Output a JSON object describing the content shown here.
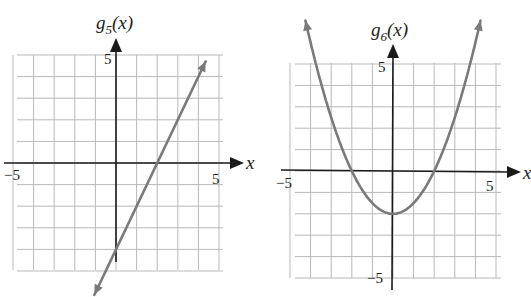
{
  "chart_data": [
    {
      "type": "line",
      "title": "g5(x)",
      "function_label": "g",
      "function_subscript": "5",
      "function_arg": "(x)",
      "xlabel": "x",
      "ylabel": "g5(x)",
      "xlim": [
        -5,
        5
      ],
      "ylim": [
        -5,
        5
      ],
      "grid": true,
      "tick_labels": {
        "x_min": "−5",
        "x_max": "5",
        "y_max": "5"
      },
      "equation": "g5(x) = 2x - 4",
      "x": [
        -1,
        0,
        1,
        2,
        3,
        4,
        4.2
      ],
      "y": [
        -6,
        -4,
        -2,
        0,
        2,
        4,
        4.4
      ],
      "x_intercept": 2,
      "y_intercept": -4,
      "line_color": "#7a7a7a"
    },
    {
      "type": "line",
      "title": "g6(x)",
      "function_label": "g",
      "function_subscript": "6",
      "function_arg": "(x)",
      "xlabel": "x",
      "ylabel": "g6(x)",
      "xlim": [
        -5,
        5
      ],
      "ylim": [
        -5,
        5
      ],
      "grid": true,
      "tick_labels": {
        "x_min": "−5",
        "x_max": "5",
        "y_max": "5",
        "y_min": "−5"
      },
      "equation": "g6(x) = 0.5x^2 - 2",
      "x": [
        -4.2,
        -4,
        -3,
        -2,
        -1,
        0,
        1,
        2,
        3,
        4,
        4.2
      ],
      "y": [
        6.82,
        6,
        2.5,
        0,
        -1.5,
        -2,
        -1.5,
        0,
        2.5,
        6,
        6.82
      ],
      "vertex": [
        0,
        -2
      ],
      "x_intercepts": [
        -2,
        2
      ],
      "line_color": "#7a7a7a"
    }
  ],
  "graphs": [
    {
      "fn": "g",
      "sub": "5",
      "arg": "(x)",
      "x_axis_label": "x",
      "xmin_label": "−5",
      "xmax_label": "5",
      "ymax_label": "5"
    },
    {
      "fn": "g",
      "sub": "6",
      "arg": "(x)",
      "x_axis_label": "x",
      "xmin_label": "−5",
      "xmax_label": "5",
      "ymax_label": "5",
      "ymin_label": "−5"
    }
  ],
  "colors": {
    "grid": "#b9b9b9",
    "axis": "#1a1a1a",
    "curve": "#7a7a7a"
  }
}
